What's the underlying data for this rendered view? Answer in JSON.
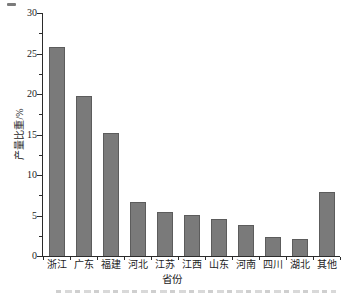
{
  "chart_data": {
    "type": "bar",
    "title": "",
    "categories": [
      "浙江",
      "广东",
      "福建",
      "河北",
      "江苏",
      "江西",
      "山东",
      "河南",
      "四川",
      "湖北",
      "其他"
    ],
    "values": [
      25.8,
      19.7,
      15.2,
      6.7,
      5.4,
      5.1,
      4.6,
      3.8,
      2.3,
      2.1,
      7.9
    ],
    "xlabel": "省份",
    "ylabel": "产量比重/%",
    "ylim": [
      0,
      30
    ],
    "yticks": [
      0,
      5,
      10,
      15,
      20,
      25,
      30
    ],
    "minor_tick_step": 2.5,
    "grid": false,
    "legend_position": "none",
    "bar_color": "#7a7a7a",
    "bar_border_color": "#5c5c5c",
    "axis_color": "#2b2b2b",
    "text_color": "#1c1c1c",
    "background_color": "#ffffff"
  }
}
